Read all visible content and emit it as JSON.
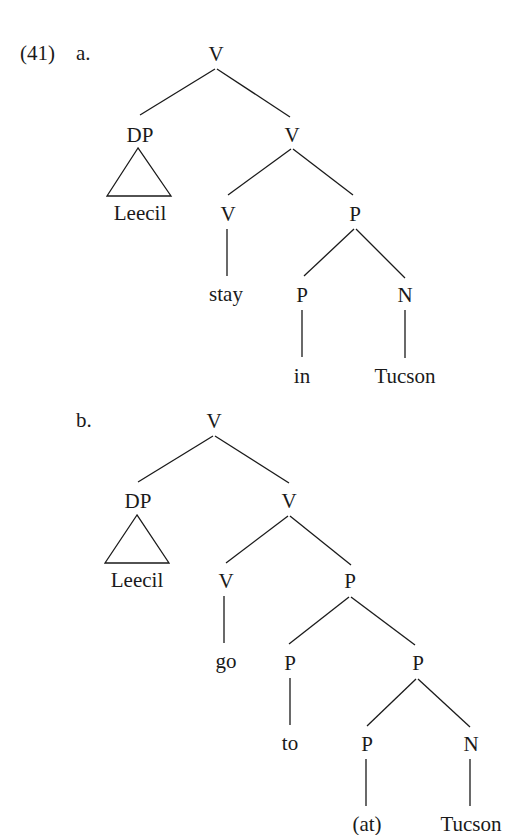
{
  "example": {
    "number": "(41)",
    "trees": [
      {
        "label": "a.",
        "nodes": {
          "root": "V",
          "spec": "DP",
          "spec_terminal": "Leecil",
          "vbar": "V",
          "v_head": "V",
          "v_word": "stay",
          "pp": "P",
          "p_head": "P",
          "p_word": "in",
          "n": "N",
          "n_word": "Tucson"
        }
      },
      {
        "label": "b.",
        "nodes": {
          "root": "V",
          "spec": "DP",
          "spec_terminal": "Leecil",
          "vbar": "V",
          "v_head": "V",
          "v_word": "go",
          "pp": "P",
          "p_head": "P",
          "p_word": "to",
          "pp2": "P",
          "p2_head": "P",
          "p2_word": "(at)",
          "n": "N",
          "n_word": "Tucson"
        }
      }
    ]
  }
}
